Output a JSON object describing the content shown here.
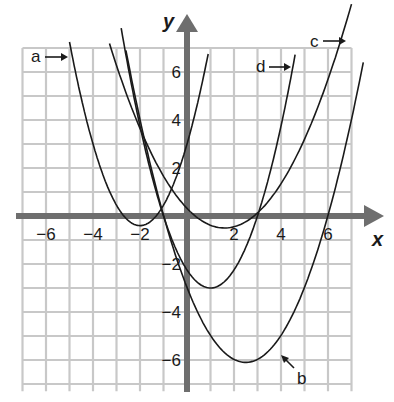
{
  "chart_data": {
    "type": "line",
    "title": "",
    "xlabel": "x",
    "ylabel": "y",
    "xlim": [
      -7,
      7
    ],
    "ylim": [
      -7,
      7
    ],
    "grid": true,
    "x_ticks": [
      -6,
      -4,
      -2,
      2,
      4,
      6
    ],
    "y_ticks": [
      6,
      4,
      2,
      -2,
      -4,
      -6
    ],
    "x_tick_labels": [
      "−6",
      "−4",
      "−2",
      "2",
      "4",
      "6"
    ],
    "y_tick_labels": [
      "6",
      "4",
      "2",
      "−2",
      "−4",
      "−6"
    ],
    "series": [
      {
        "name": "a",
        "form": "parabola",
        "vertex": [
          -2,
          -0.4
        ],
        "a_coef": 0.85,
        "domain": [
          -5,
          0.9
        ]
      },
      {
        "name": "b",
        "form": "parabola",
        "vertex": [
          2.5,
          -6.1
        ],
        "a_coef": 0.5,
        "domain": [
          -2.6,
          7.5
        ]
      },
      {
        "name": "c",
        "form": "parabola",
        "vertex": [
          1.6,
          -0.5
        ],
        "a_coef": 0.32,
        "domain": [
          -3.3,
          7.0
        ]
      },
      {
        "name": "d",
        "form": "parabola",
        "vertex": [
          1,
          -3
        ],
        "a_coef": 0.75,
        "domain": [
          -2.8,
          4.6
        ]
      }
    ],
    "labels": {
      "a": "a",
      "b": "b",
      "c": "c",
      "d": "d"
    },
    "colors": {
      "grid": "#c8c8c8",
      "axis": "#6e6e6e",
      "curve": "#1a1a1a",
      "text": "#1a1a1a"
    }
  }
}
